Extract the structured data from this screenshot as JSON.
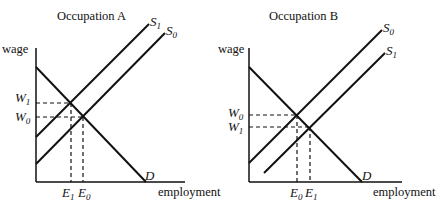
{
  "panels": [
    {
      "title": "Occupation A",
      "y_axis_label": "wage",
      "x_axis_label": "employment",
      "demand_label": "D",
      "supply_labels": [
        "S",
        "S"
      ],
      "supply_subs": [
        "1",
        "0"
      ],
      "wage_labels": [
        {
          "main": "W",
          "sub": "1"
        },
        {
          "main": "W",
          "sub": "0"
        }
      ],
      "employment_labels": [
        {
          "main": "E",
          "sub": "1"
        },
        {
          "main": "E",
          "sub": "0"
        }
      ]
    },
    {
      "title": "Occupation B",
      "y_axis_label": "wage",
      "x_axis_label": "employment",
      "demand_label": "D",
      "supply_labels": [
        "S",
        "S"
      ],
      "supply_subs": [
        "0",
        "1"
      ],
      "wage_labels": [
        {
          "main": "W",
          "sub": "0"
        },
        {
          "main": "W",
          "sub": "1"
        }
      ],
      "employment_labels": [
        {
          "main": "E",
          "sub": "0"
        },
        {
          "main": "E",
          "sub": "1"
        }
      ]
    }
  ],
  "colors": {
    "line": "#111111",
    "background": "#ffffff"
  }
}
